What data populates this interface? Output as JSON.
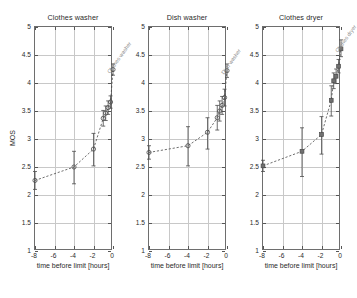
{
  "figure": {
    "background": "#ffffff",
    "line_color": "#4a4a4a",
    "grid_color": "#c8c8c8",
    "axis_color": "#6e6e6e",
    "text_color": "#2a2a2a"
  },
  "axis": {
    "xlabel": "time before limit [hours]",
    "ylabel": "MOS",
    "xticks": [
      "-8",
      "-6",
      "-4",
      "-2",
      "0"
    ],
    "xtick_values": [
      -8,
      -6,
      -4,
      -2,
      0
    ],
    "yticks": [
      "1",
      "1.5",
      "2",
      "2.5",
      "3",
      "3.5",
      "4",
      "4.5",
      "5"
    ],
    "ytick_values": [
      1,
      1.5,
      2,
      2.5,
      3,
      3.5,
      4,
      4.5,
      5
    ],
    "xlim": [
      -8,
      0
    ],
    "ylim": [
      1,
      5
    ],
    "grid": true
  },
  "chart_data": [
    {
      "type": "line",
      "title": "Clothes washer",
      "xlabel": "time before limit [hours]",
      "ylabel": "MOS",
      "xlim": [
        -8,
        0
      ],
      "ylim": [
        1,
        5
      ],
      "grid": true,
      "legend": "none",
      "marker": "circle",
      "linestyle": "dashed",
      "x": [
        -8,
        -4,
        -2,
        -1,
        -0.75,
        -0.5,
        -0.25,
        0
      ],
      "values": [
        2.26,
        2.5,
        2.82,
        3.37,
        3.46,
        3.56,
        3.66,
        4.24
      ],
      "yerr_low": [
        0.16,
        0.3,
        0.3,
        0.14,
        0.13,
        0.12,
        0.11,
        0.1
      ],
      "yerr_high": [
        0.16,
        0.28,
        0.28,
        0.14,
        0.13,
        0.12,
        0.11,
        0.1
      ]
    },
    {
      "type": "line",
      "title": "Dish washer",
      "xlabel": "time before limit [hours]",
      "ylabel": "MOS",
      "xlim": [
        -8,
        0
      ],
      "ylim": [
        1,
        5
      ],
      "grid": true,
      "legend": "none",
      "marker": "circle",
      "linestyle": "dashed",
      "x": [
        -8,
        -4,
        -2,
        -1,
        -0.75,
        -0.5,
        -0.25,
        0
      ],
      "values": [
        2.76,
        2.88,
        3.12,
        3.38,
        3.5,
        3.6,
        3.74,
        4.22
      ],
      "yerr_low": [
        0.12,
        0.36,
        0.3,
        0.22,
        0.18,
        0.16,
        0.15,
        0.12
      ],
      "yerr_high": [
        0.12,
        0.34,
        0.26,
        0.22,
        0.18,
        0.16,
        0.15,
        0.12
      ]
    },
    {
      "type": "line",
      "title": "Clothes dryer",
      "xlabel": "time before limit [hours]",
      "ylabel": "MOS",
      "xlim": [
        -8,
        0
      ],
      "ylim": [
        1,
        5
      ],
      "grid": true,
      "legend": "none",
      "marker": "square",
      "linestyle": "dashed",
      "x": [
        -8,
        -4,
        -2,
        -1,
        -0.75,
        -0.5,
        -0.25,
        0
      ],
      "values": [
        2.52,
        2.78,
        3.08,
        3.69,
        4.04,
        4.12,
        4.3,
        4.61
      ],
      "yerr_low": [
        0.1,
        0.45,
        0.35,
        0.28,
        0.14,
        0.13,
        0.12,
        0.14
      ],
      "yerr_high": [
        0.1,
        0.42,
        0.32,
        0.26,
        0.14,
        0.13,
        0.12,
        0.16
      ]
    }
  ],
  "panels": [
    {
      "title": "Clothes washer",
      "show_ylabel": true
    },
    {
      "title": "Dish washer",
      "show_ylabel": false
    },
    {
      "title": "Clothes dryer",
      "show_ylabel": false
    }
  ]
}
